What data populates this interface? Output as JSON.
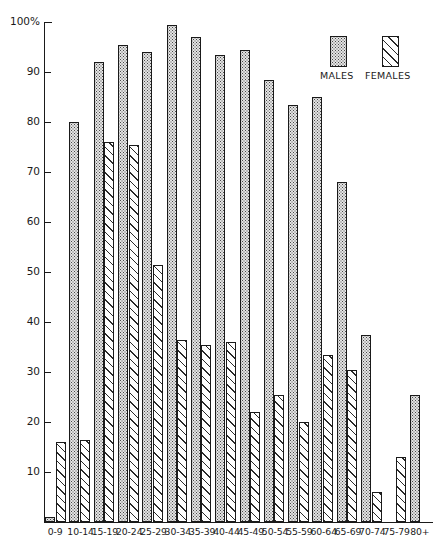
{
  "chart_data": {
    "type": "bar",
    "title": "",
    "xlabel": "",
    "ylabel": "",
    "ylim": [
      0,
      100
    ],
    "yticks": [
      0,
      10,
      20,
      30,
      40,
      50,
      60,
      70,
      80,
      90,
      100
    ],
    "ytick_labels": [
      "",
      "10",
      "20",
      "30",
      "40",
      "50",
      "60",
      "70",
      "80",
      "90",
      "100%"
    ],
    "grid": false,
    "legend_position": "top-right",
    "categories": [
      "0-9",
      "10-14",
      "15-19",
      "20-24",
      "25-29",
      "30-34",
      "35-39",
      "40-44",
      "45-49",
      "50-54",
      "55-59",
      "60-64",
      "65-69",
      "70-74",
      "75-79",
      "80+"
    ],
    "series": [
      {
        "name": "MALES",
        "fill": "stipple",
        "values": [
          1,
          80,
          92,
          95.5,
          94,
          99.5,
          97,
          93.5,
          94.5,
          88.5,
          83.5,
          85,
          68,
          37.5,
          0,
          25.5
        ]
      },
      {
        "name": "FEMALES",
        "fill": "diagonal-hatch",
        "values": [
          16,
          16.5,
          76,
          75.5,
          51.5,
          36.5,
          35.5,
          36,
          22,
          25.5,
          20,
          33.5,
          30.5,
          6,
          13,
          0
        ]
      }
    ]
  },
  "axis": {
    "y_top_label": "100%",
    "labels": [
      "100%",
      "90",
      "80",
      "70",
      "60",
      "50",
      "40",
      "30",
      "20",
      "10"
    ]
  },
  "legend": {
    "males_label": "MALES",
    "females_label": "FEMALES"
  },
  "colors": {
    "ink": "#1a1a1a",
    "males_fill": "#e4e4e4",
    "females_fill": "#ffffff",
    "background": "#ffffff"
  }
}
